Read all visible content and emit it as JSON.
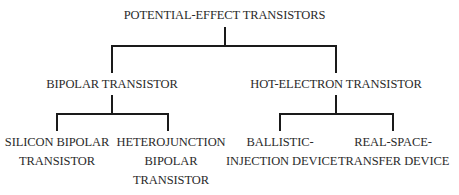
{
  "diagram": {
    "root": {
      "label": "POTENTIAL-EFFECT TRANSISTORS"
    },
    "level1": [
      {
        "label": "BIPOLAR TRANSISTOR",
        "children": [
          {
            "lines": [
              "SILICON BIPOLAR",
              "TRANSISTOR"
            ]
          },
          {
            "lines": [
              "HETEROJUNCTION",
              "BIPOLAR",
              "TRANSISTOR"
            ]
          }
        ]
      },
      {
        "label": "HOT-ELECTRON TRANSISTOR",
        "children": [
          {
            "lines": [
              "BALLISTIC-",
              "INJECTION DEVICE"
            ]
          },
          {
            "lines": [
              "REAL-SPACE-",
              "TRANSFER DEVICE"
            ]
          }
        ]
      }
    ],
    "line_color": "#1a1a1a"
  }
}
